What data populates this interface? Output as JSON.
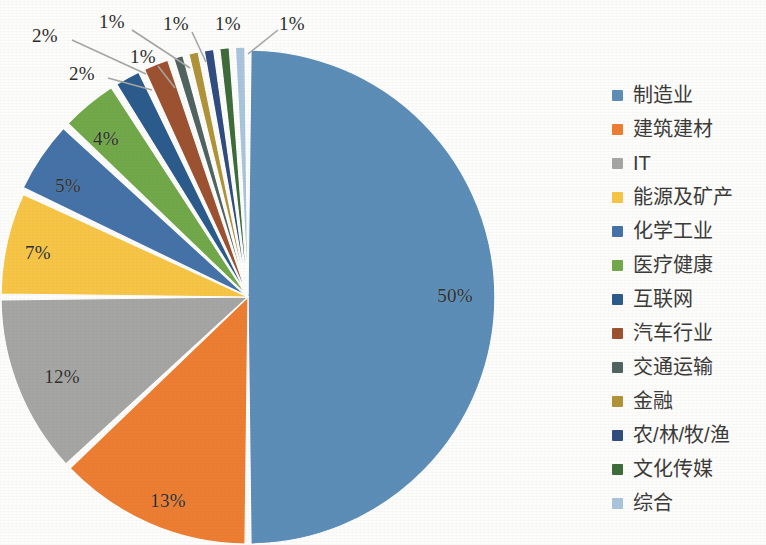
{
  "chart_data": {
    "type": "pie",
    "title": "",
    "subtitle": "",
    "xlabel": "",
    "ylabel": "",
    "legend_position": "right",
    "grid": false,
    "value_suffix": "%",
    "categories": [
      "制造业",
      "建筑建材",
      "IT",
      "能源及矿产",
      "化学工业",
      "医疗健康",
      "互联网",
      "汽车行业",
      "交通运输",
      "金融",
      "农/林/牧/渔",
      "文化传媒",
      "综合"
    ],
    "values": [
      50,
      13,
      12,
      7,
      5,
      4,
      2,
      2,
      1,
      1,
      1,
      1,
      1
    ],
    "labels": [
      "50%",
      "13%",
      "12%",
      "7%",
      "5%",
      "4%",
      "2%",
      "2%",
      "1%",
      "1%",
      "1%",
      "1%",
      "1%"
    ],
    "colors": [
      "#5b8db8",
      "#ed7d31",
      "#a5a5a5",
      "#f7c545",
      "#4472a8",
      "#70a84a",
      "#2a5b8c",
      "#9c5130",
      "#4f6360",
      "#b09339",
      "#2f4b80",
      "#3d6b3a",
      "#a8c5dd"
    ],
    "slices": [
      {
        "label": "制造业",
        "value": 50,
        "display": "50%",
        "color": "#5b8db8",
        "label_x": 455,
        "label_y": 296,
        "leader": false
      },
      {
        "label": "建筑建材",
        "value": 13,
        "display": "13%",
        "color": "#ed7d31",
        "label_x": 168,
        "label_y": 501,
        "leader": false
      },
      {
        "label": "IT",
        "value": 12,
        "display": "12%",
        "color": "#a5a5a5",
        "label_x": 62,
        "label_y": 377,
        "leader": false
      },
      {
        "label": "能源及矿产",
        "value": 7,
        "display": "7%",
        "color": "#f7c545",
        "label_x": 38,
        "label_y": 253,
        "leader": false
      },
      {
        "label": "化学工业",
        "value": 5,
        "display": "5%",
        "color": "#4472a8",
        "label_x": 68,
        "label_y": 186,
        "leader": false
      },
      {
        "label": "医疗健康",
        "value": 4,
        "display": "4%",
        "color": "#70a84a",
        "label_x": 106,
        "label_y": 139,
        "leader": false
      },
      {
        "label": "互联网",
        "value": 2,
        "display": "2%",
        "color": "#2a5b8c",
        "label_x": 45,
        "label_y": 36,
        "leader": true,
        "lx1": 72,
        "ly1": 40,
        "lx2": 146,
        "ly2": 74
      },
      {
        "label": "汽车行业",
        "value": 2,
        "display": "2%",
        "color": "#9c5130",
        "label_x": 82,
        "label_y": 74,
        "leader": true,
        "lx1": 108,
        "ly1": 78,
        "lx2": 152,
        "ly2": 90
      },
      {
        "label": "交通运输",
        "value": 1,
        "display": "1%",
        "color": "#4f6360",
        "label_x": 143,
        "label_y": 57,
        "leader": true,
        "lx1": 158,
        "ly1": 66,
        "lx2": 175,
        "ly2": 88
      },
      {
        "label": "金融",
        "value": 1,
        "display": "1%",
        "color": "#b09339",
        "label_x": 112,
        "label_y": 22,
        "leader": true,
        "lx1": 132,
        "ly1": 30,
        "lx2": 190,
        "ly2": 68
      },
      {
        "label": "农/林/牧/渔",
        "value": 1,
        "display": "1%",
        "color": "#2f4b80",
        "label_x": 176,
        "label_y": 24,
        "leader": true,
        "lx1": 192,
        "ly1": 32,
        "lx2": 206,
        "ly2": 62
      },
      {
        "label": "文化传媒",
        "value": 1,
        "display": "1%",
        "color": "#3d6b3a",
        "label_x": 228,
        "label_y": 24,
        "leader": false
      },
      {
        "label": "综合",
        "value": 1,
        "display": "1%",
        "color": "#a8c5dd",
        "label_x": 292,
        "label_y": 24,
        "leader": true,
        "lx1": 278,
        "ly1": 30,
        "lx2": 248,
        "ly2": 54
      }
    ],
    "geometry": {
      "center_x": 248,
      "center_y": 297,
      "radius": 247,
      "start_angle_deg": -90,
      "direction": "clockwise",
      "explode_gap_deg": 1.4
    }
  },
  "legend": {
    "items": [
      {
        "label": "制造业",
        "color": "#5b8db8"
      },
      {
        "label": "建筑建材",
        "color": "#ed7d31"
      },
      {
        "label": "IT",
        "color": "#a5a5a5"
      },
      {
        "label": "能源及矿产",
        "color": "#f7c545"
      },
      {
        "label": "化学工业",
        "color": "#4472a8"
      },
      {
        "label": "医疗健康",
        "color": "#70a84a"
      },
      {
        "label": "互联网",
        "color": "#2a5b8c"
      },
      {
        "label": "汽车行业",
        "color": "#9c5130"
      },
      {
        "label": "交通运输",
        "color": "#4f6360"
      },
      {
        "label": "金融",
        "color": "#b09339"
      },
      {
        "label": "农/林/牧/渔",
        "color": "#2f4b80"
      },
      {
        "label": "文化传媒",
        "color": "#3d6b3a"
      },
      {
        "label": "综合",
        "color": "#a8c5dd"
      }
    ]
  }
}
